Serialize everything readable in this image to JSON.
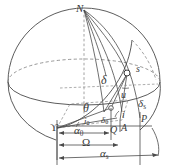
{
  "figure": {
    "name": "celestial-sphere-orbit-diagram",
    "background_color": "#ffffff",
    "line_color": "#4a4a4a",
    "dashed_color": "#8a8a8a",
    "text_color": "#3a3a3a",
    "width": 169,
    "height": 168
  },
  "labels": {
    "north_pole": "N",
    "satellite": "s",
    "declination": "δ",
    "declination_sub_s": "δ",
    "declination_sub_s_index": "s",
    "declination_sub_0": "δ",
    "declination_sub_0_index": "0",
    "argument_of_latitude": "u",
    "inclination": "i",
    "inclination_sub_0": "i",
    "inclination_sub_0_index": "0",
    "theta": "θ",
    "vernal_equinox": "ϒ",
    "point_q": "Q",
    "point_a": "A",
    "point_p": "P",
    "right_ascension_0": "α",
    "right_ascension_0_index": "0",
    "raan": "Ω",
    "right_ascension_s": "α",
    "right_ascension_s_index": "s"
  },
  "dimensions": [
    {
      "id": "alpha-0",
      "symbol": "α",
      "subscript": "0"
    },
    {
      "id": "raan",
      "symbol": "Ω",
      "subscript": ""
    },
    {
      "id": "alpha-s",
      "symbol": "α",
      "subscript": "s"
    }
  ],
  "points": [
    {
      "id": "north-pole",
      "label": "N"
    },
    {
      "id": "satellite",
      "label": "s"
    },
    {
      "id": "vernal-equinox",
      "label": "ϒ"
    },
    {
      "id": "point-q",
      "label": "Q"
    },
    {
      "id": "point-a",
      "label": "A"
    },
    {
      "id": "point-p",
      "label": "P"
    }
  ],
  "angles": [
    {
      "id": "delta",
      "label": "δ"
    },
    {
      "id": "delta-s",
      "label": "δs"
    },
    {
      "id": "delta-0",
      "label": "δ0"
    },
    {
      "id": "u",
      "label": "u"
    },
    {
      "id": "i",
      "label": "i"
    },
    {
      "id": "i-0",
      "label": "i0"
    },
    {
      "id": "theta",
      "label": "θ"
    }
  ]
}
